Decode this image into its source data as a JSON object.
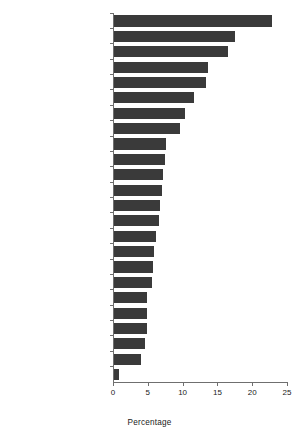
{
  "chart_data": {
    "type": "bar",
    "orientation": "horizontal",
    "title": "",
    "xlabel": "Percentage",
    "ylabel": "",
    "xlim": [
      0,
      25
    ],
    "xticks": [
      0,
      5,
      10,
      15,
      20,
      25
    ],
    "grid": false,
    "legend": null,
    "bar_color": "#3a3a3a",
    "axis_color": "#6f6f6f",
    "categories": [
      "Guatemala (2002)",
      "Haiti (2000)",
      "Honduras (2001)",
      "Guyana (2000)",
      "Suriname (2000)",
      "Ecuador (2000)",
      "El Salvador (2003)",
      "Nicaragua (2001)",
      "Mexico (1999)",
      "Bolivia (2003)",
      "Peru (2000)",
      "Panama (1997)",
      "Colombia (2000)",
      "Belize (1992)",
      "Brazil (1996)",
      "Argentina (1996)",
      "Dominican Republic (2002)",
      "Costa Rica (1996)",
      "Paraguay (2001)",
      "Uruguay (1996)",
      "Venezuela (2000)",
      "Cuba (2000)",
      "Jamaica (2002)",
      "Chile (2003)"
    ],
    "values": [
      22.7,
      17.4,
      16.4,
      13.5,
      13.2,
      11.5,
      10.2,
      9.5,
      7.4,
      7.3,
      7.0,
      6.9,
      6.6,
      6.5,
      6.0,
      5.7,
      5.6,
      5.5,
      4.8,
      4.8,
      4.7,
      4.4,
      3.9,
      0.7
    ]
  }
}
